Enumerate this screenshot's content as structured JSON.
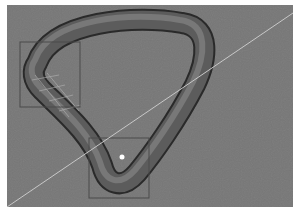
{
  "viewport": {
    "background": "#767676",
    "mode": "3d-perspective",
    "object": {
      "type": "rounded-triangle-tube",
      "shading": "smooth-gray",
      "base_color": "#6a6a6a",
      "highlight_color": "#9a9a9a",
      "shadow_color": "#2e2e2e"
    },
    "selection_boxes": [
      {
        "label": "",
        "x": 13,
        "y": 37,
        "w": 60,
        "h": 65
      },
      {
        "label": "",
        "x": 82,
        "y": 133,
        "w": 60,
        "h": 60
      }
    ],
    "guide_line": {
      "x1": 0,
      "y1": 202,
      "x2": 286,
      "y2": 8,
      "color": "#c8c8c8"
    },
    "selected_vertex": {
      "x": 115,
      "y": 152,
      "color": "#ffffff"
    }
  }
}
